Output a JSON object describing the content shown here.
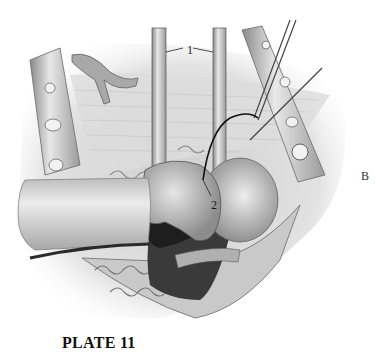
{
  "figure": {
    "title": "PLATE 11",
    "panel_letter": "B",
    "labels": [
      {
        "id": "1",
        "text": "1",
        "points_to": "two parallel retractor blades"
      },
      {
        "id": "2",
        "text": "2",
        "points_to": "suture point on tissue"
      }
    ],
    "style": "grayscale pencil surgical illustration",
    "colors": {
      "background": "#ffffff",
      "ink": "#1a1a1a",
      "mid_gray": "#9a9a9a",
      "light_gray": "#d8d8d8",
      "dark_tissue": "#2a2a2a"
    }
  }
}
